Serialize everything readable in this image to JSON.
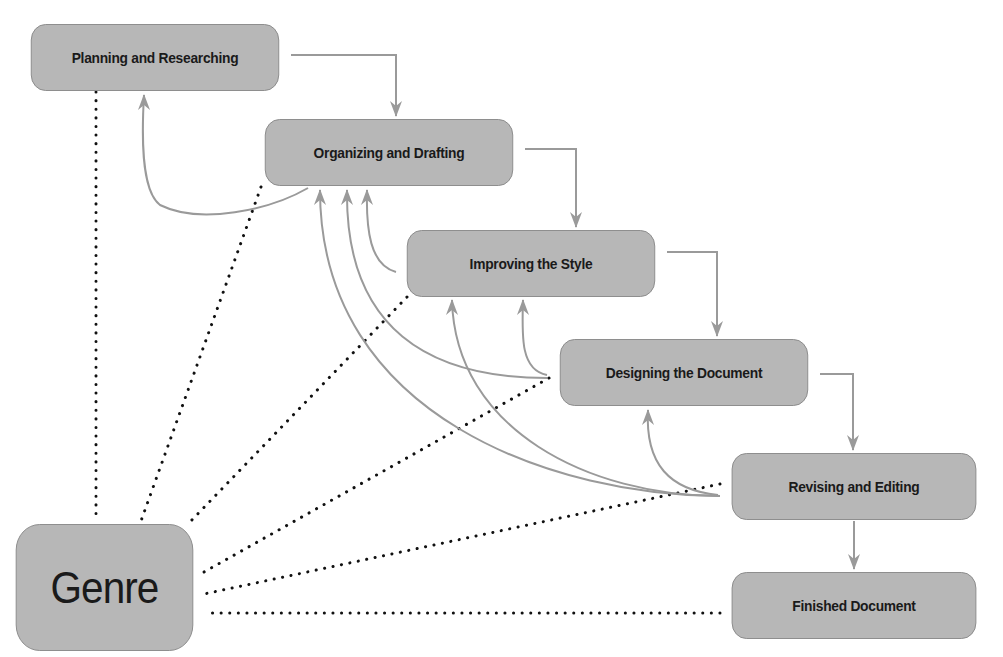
{
  "diagram": {
    "type": "writing-process-flow",
    "colors": {
      "box_fill": "#b7b7b7",
      "box_border": "#8a8a8a",
      "arrow": "#9a9a9a",
      "dotted_line": "#111111",
      "text": "#1a1a1a"
    },
    "nodes": [
      {
        "id": "planning",
        "label": "Planning and Researching",
        "x": 20,
        "y": 24,
        "w": 270,
        "h": 67
      },
      {
        "id": "organizing",
        "label": "Organizing and Drafting",
        "x": 254,
        "y": 119,
        "w": 270,
        "h": 67
      },
      {
        "id": "improving",
        "label": "Improving the Style",
        "x": 396,
        "y": 230,
        "w": 270,
        "h": 67
      },
      {
        "id": "designing",
        "label": "Designing the Document",
        "x": 549,
        "y": 339,
        "w": 270,
        "h": 67
      },
      {
        "id": "revising",
        "label": "Revising and Editing",
        "x": 721,
        "y": 453,
        "w": 266,
        "h": 67
      },
      {
        "id": "finished",
        "label": "Finished Document",
        "x": 721,
        "y": 572,
        "w": 266,
        "h": 67
      },
      {
        "id": "genre",
        "label": "Genre",
        "x": 8,
        "y": 524,
        "w": 193,
        "h": 127
      }
    ],
    "forward_arrows": [
      {
        "from": "planning",
        "to": "organizing"
      },
      {
        "from": "organizing",
        "to": "improving"
      },
      {
        "from": "improving",
        "to": "designing"
      },
      {
        "from": "designing",
        "to": "revising"
      },
      {
        "from": "revising",
        "to": "finished"
      }
    ],
    "feedback_arrows": [
      {
        "from": "organizing",
        "to": "planning"
      },
      {
        "from": "improving",
        "to": "organizing"
      },
      {
        "from": "designing",
        "to": "organizing"
      },
      {
        "from": "designing",
        "to": "improving"
      },
      {
        "from": "revising",
        "to": "organizing"
      },
      {
        "from": "revising",
        "to": "improving"
      },
      {
        "from": "revising",
        "to": "designing"
      }
    ],
    "dotted_links": [
      {
        "from": "genre",
        "to": "planning"
      },
      {
        "from": "genre",
        "to": "organizing"
      },
      {
        "from": "genre",
        "to": "improving"
      },
      {
        "from": "genre",
        "to": "designing"
      },
      {
        "from": "genre",
        "to": "revising"
      },
      {
        "from": "genre",
        "to": "finished"
      }
    ]
  }
}
